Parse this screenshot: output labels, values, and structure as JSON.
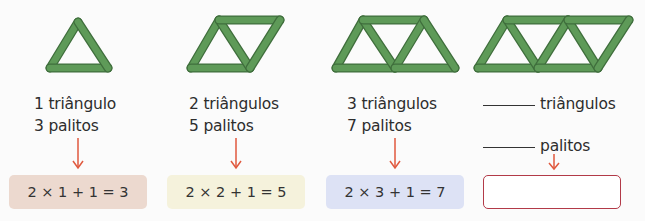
{
  "colors": {
    "stick_fill": "#5e9a58",
    "stick_edge": "#3f6e3c",
    "arrow": "#e0593e",
    "answer_border": "#b23a48",
    "text": "#2d2d2d"
  },
  "columns": [
    {
      "triangles_label": "1 triângulo",
      "sticks_label": "3 palitos",
      "expression": "2 × 1 + 1 = 3",
      "box_color": "#ecd9cf"
    },
    {
      "triangles_label": "2 triângulos",
      "sticks_label": "5 palitos",
      "expression": "2 × 2 + 1 = 5",
      "box_color": "#f5f2dc"
    },
    {
      "triangles_label": "3 triângulos",
      "sticks_label": "7 palitos",
      "expression": "2 × 3 + 1 = 7",
      "box_color": "#dde2f5"
    },
    {
      "triangles_label": "triângulos",
      "sticks_label": "palitos",
      "expression": "",
      "blank_triangles": "",
      "blank_sticks": ""
    }
  ]
}
